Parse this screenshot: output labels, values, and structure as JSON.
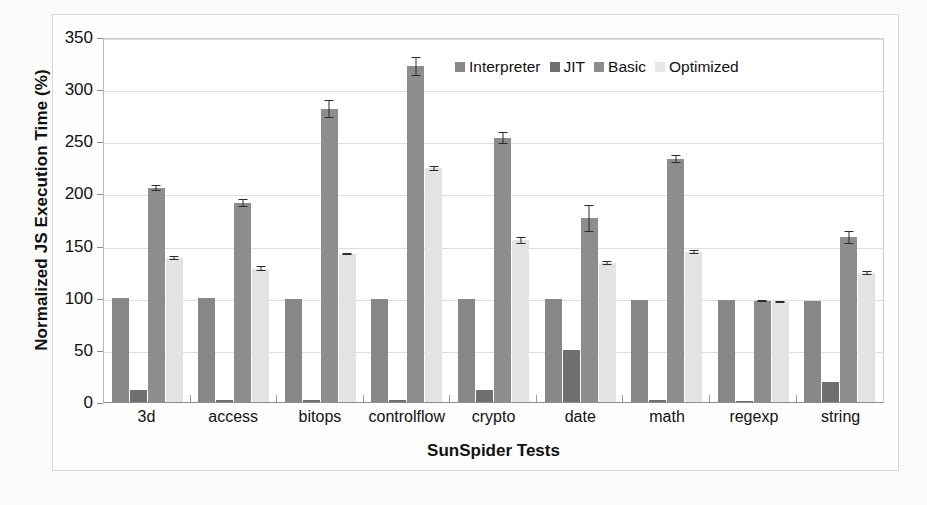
{
  "chart_data": {
    "type": "bar",
    "title": "",
    "xlabel": "SunSpider Tests",
    "ylabel": "Normalized JS Execution Time (%)",
    "ylim": [
      0,
      350
    ],
    "ytick_step": 50,
    "yticks": [
      0,
      50,
      100,
      150,
      200,
      250,
      300,
      350
    ],
    "grid": true,
    "legend_position": "inside top-center",
    "categories": [
      "3d",
      "access",
      "bitops",
      "controlflow",
      "crypto",
      "date",
      "math",
      "regexp",
      "string"
    ],
    "series": [
      {
        "name": "Interpreter",
        "color": "#878787",
        "values": [
          100,
          100,
          99,
          99,
          99,
          99,
          98,
          98,
          97
        ],
        "errors": [
          0,
          0,
          0,
          0,
          0,
          0,
          0,
          0,
          0
        ]
      },
      {
        "name": "JIT",
        "color": "#6f6f6f",
        "values": [
          12,
          2,
          2,
          2,
          12,
          50,
          2,
          1,
          19
        ],
        "errors": [
          0,
          0,
          0,
          0,
          0,
          0,
          0,
          0,
          0
        ]
      },
      {
        "name": "Basic",
        "color": "#8d8d8d",
        "values": [
          205,
          191,
          281,
          322,
          253,
          176,
          233,
          97,
          158
        ],
        "errors": [
          3,
          4,
          9,
          9,
          6,
          13,
          4,
          1,
          6
        ]
      },
      {
        "name": "Optimized",
        "color": "#e3e3e3",
        "values": [
          138,
          128,
          142,
          224,
          155,
          133,
          144,
          96,
          124
        ],
        "errors": [
          2,
          2,
          1,
          2,
          3,
          2,
          2,
          1,
          2
        ]
      }
    ]
  },
  "legend": {
    "items": [
      {
        "label": "Interpreter",
        "icon": "legend-swatch-icon"
      },
      {
        "label": "JIT",
        "icon": "legend-swatch-icon"
      },
      {
        "label": "Basic",
        "icon": "legend-swatch-icon"
      },
      {
        "label": "Optimized",
        "icon": "legend-swatch-icon"
      }
    ]
  },
  "caption": ""
}
